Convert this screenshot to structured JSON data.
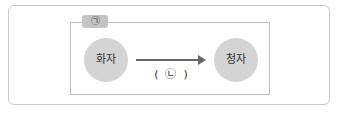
{
  "diagram": {
    "tag_label": "㉠",
    "left_node": "화자",
    "right_node": "청자",
    "arrow_label": "(  ㉡  )"
  }
}
